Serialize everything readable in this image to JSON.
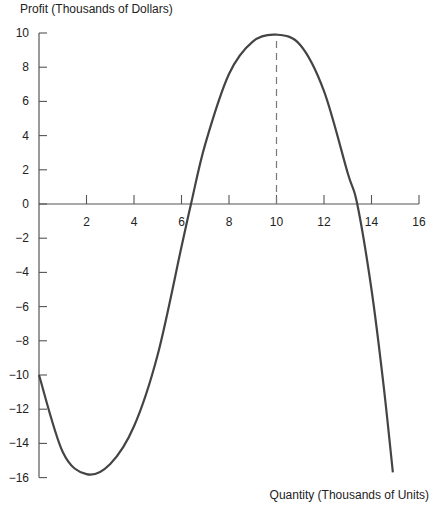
{
  "chart_data": {
    "type": "line",
    "title": "",
    "ylabel": "Profit (Thousands of Dollars)",
    "xlabel": "Quantity (Thousands of Units)",
    "xlim": [
      0,
      16
    ],
    "ylim": [
      -16,
      10
    ],
    "x_ticks": [
      2,
      4,
      6,
      8,
      10,
      12,
      14,
      16
    ],
    "y_ticks": [
      10,
      8,
      6,
      4,
      2,
      0,
      -2,
      -4,
      -6,
      -8,
      -10,
      -12,
      -14,
      -16
    ],
    "y_tick_labels": [
      "10",
      "8",
      "6",
      "4",
      "2",
      "0",
      "−2",
      "−4",
      "−6",
      "−8",
      "−10",
      "−12",
      "−14",
      "−16"
    ],
    "grid": false,
    "legend": null,
    "series": [
      {
        "name": "Profit",
        "color": "#444444",
        "x": [
          0,
          1,
          2,
          3,
          4,
          5,
          6,
          6.4,
          7,
          8,
          9,
          10,
          11,
          12,
          13,
          13.4,
          14,
          14.5,
          14.9
        ],
        "y": [
          -10,
          -14.5,
          -15.8,
          -15.2,
          -13,
          -8.8,
          -2.5,
          0,
          3.5,
          7.6,
          9.5,
          9.9,
          9.3,
          6.6,
          1.8,
          0,
          -5,
          -10.5,
          -15.7
        ]
      }
    ],
    "annotations": [
      {
        "type": "dashed-vertical-line",
        "x": 10,
        "from_y": 0,
        "to_y": 9.9,
        "label": "maximum profit"
      }
    ]
  }
}
